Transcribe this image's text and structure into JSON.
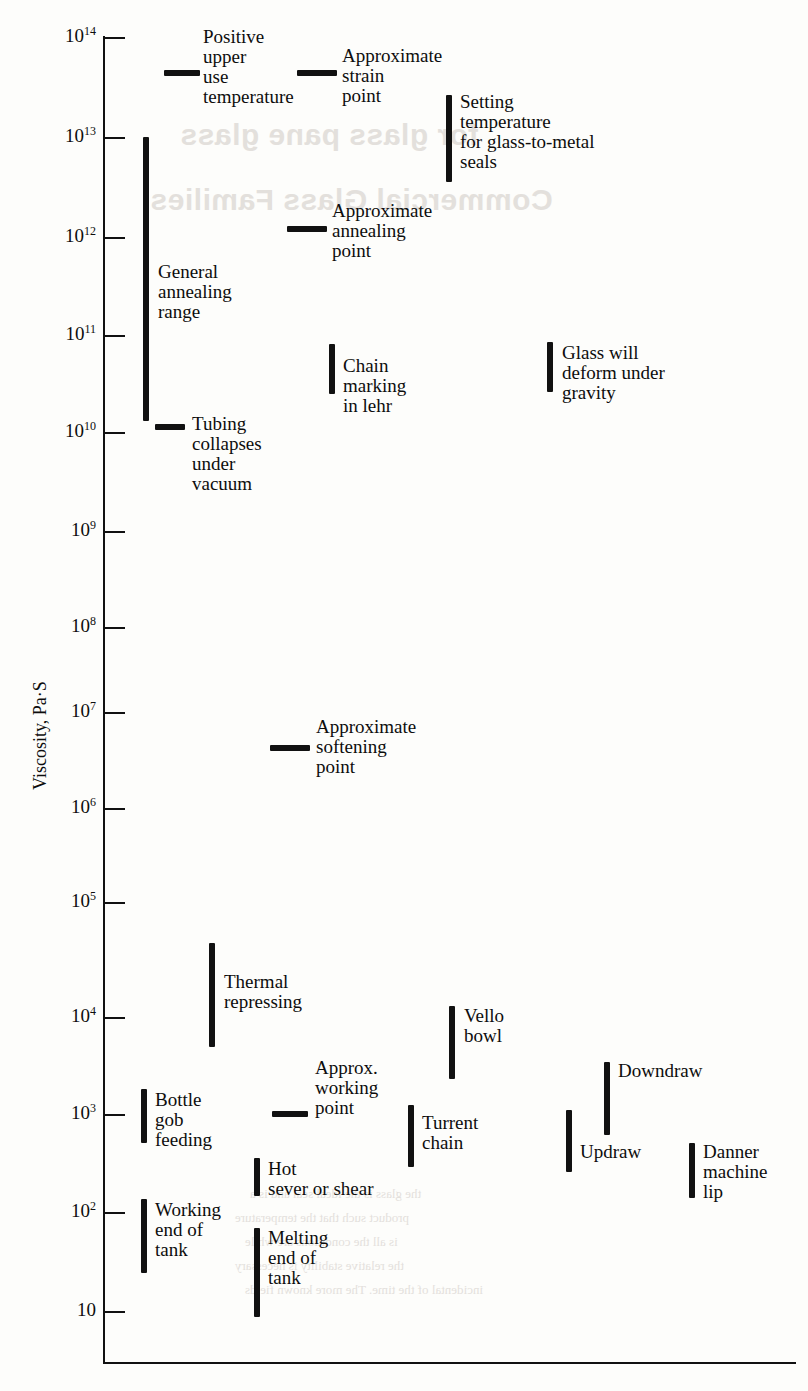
{
  "figure": {
    "y_axis_label": "Viscosity, Pa·S",
    "tick_labels": [
      "10¹⁴",
      "10¹³",
      "10¹²",
      "10¹¹",
      "10¹⁰",
      "10⁹",
      "10⁸",
      "10⁷",
      "10⁶",
      "10⁵",
      "10⁴",
      "10³",
      "10²",
      "10"
    ]
  },
  "ticks": [
    {
      "base": "10",
      "exp": "14",
      "value": 14,
      "y": 37
    },
    {
      "base": "10",
      "exp": "13",
      "value": 13,
      "y": 137
    },
    {
      "base": "10",
      "exp": "12",
      "value": 12,
      "y": 237
    },
    {
      "base": "10",
      "exp": "11",
      "value": 11,
      "y": 335
    },
    {
      "base": "10",
      "exp": "10",
      "value": 10,
      "y": 432
    },
    {
      "base": "10",
      "exp": "9",
      "value": 9,
      "y": 531
    },
    {
      "base": "10",
      "exp": "8",
      "value": 8,
      "y": 627
    },
    {
      "base": "10",
      "exp": "7",
      "value": 7,
      "y": 712
    },
    {
      "base": "10",
      "exp": "6",
      "value": 6,
      "y": 808
    },
    {
      "base": "10",
      "exp": "5",
      "value": 5,
      "y": 902
    },
    {
      "base": "10",
      "exp": "4",
      "value": 4,
      "y": 1017
    },
    {
      "base": "10",
      "exp": "3",
      "value": 3,
      "y": 1114
    },
    {
      "base": "10",
      "exp": "2",
      "value": 2,
      "y": 1212
    },
    {
      "base": "10",
      "exp": "",
      "value": 1,
      "y": 1311
    }
  ],
  "markers": [
    {
      "id": "positive-upper-use-temperature",
      "label": "Positive\nupper\nuse\ntemperature",
      "kind": "dash",
      "x": 164,
      "w": 36,
      "y": 70,
      "value_exp": 13.6,
      "label_x": 203,
      "label_y": 27
    },
    {
      "id": "approximate-strain-point",
      "label": "Approximate\nstrain\npoint",
      "kind": "dash",
      "x": 297,
      "w": 40,
      "y": 70,
      "value_exp": 13.6,
      "label_x": 342,
      "label_y": 46
    },
    {
      "id": "setting-temperature-glass-to-metal-seals",
      "label": "Setting\ntemperature\nfor glass-to-metal\nseals",
      "kind": "bar",
      "x": 446,
      "y_top": 95,
      "y_bottom": 182,
      "exp_top": 13.45,
      "exp_bottom": 12.6,
      "label_x": 460,
      "label_y": 92
    },
    {
      "id": "general-annealing-range",
      "label": "General\nannealing\nrange",
      "kind": "bar",
      "x": 143,
      "y_top": 137,
      "y_bottom": 421,
      "exp_top": 13.0,
      "exp_bottom": 10.1,
      "label_x": 158,
      "label_y": 262
    },
    {
      "id": "approximate-annealing-point",
      "label": "Approximate\nannealing\npoint",
      "kind": "dash",
      "x": 287,
      "w": 40,
      "y": 226,
      "value_exp": 12.1,
      "label_x": 332,
      "label_y": 201
    },
    {
      "id": "chain-marking-in-lehr",
      "label": "Chain\nmarking\nin lehr",
      "kind": "bar",
      "x": 329,
      "y_top": 344,
      "y_bottom": 394,
      "exp_top": 10.9,
      "exp_bottom": 10.4,
      "label_x": 343,
      "label_y": 356
    },
    {
      "id": "glass-will-deform-under-gravity",
      "label": "Glass will\ndeform under\ngravity",
      "kind": "bar",
      "x": 547,
      "y_top": 342,
      "y_bottom": 392,
      "exp_top": 10.9,
      "exp_bottom": 10.4,
      "label_x": 562,
      "label_y": 343
    },
    {
      "id": "tubing-collapses-under-vacuum",
      "label": "Tubing\ncollapses\nunder\nvacuum",
      "kind": "dash",
      "x": 155,
      "w": 30,
      "y": 424,
      "value_exp": 10.07,
      "label_x": 192,
      "label_y": 414
    },
    {
      "id": "approximate-softening-point",
      "label": "Approximate\nsoftening\npoint",
      "kind": "dash",
      "x": 270,
      "w": 40,
      "y": 745,
      "value_exp": 6.6,
      "label_x": 316,
      "label_y": 717
    },
    {
      "id": "thermal-repressing",
      "label": "Thermal\nrepressing",
      "kind": "bar",
      "x": 209,
      "y_top": 943,
      "y_bottom": 1047,
      "exp_top": 4.65,
      "exp_bottom": 3.6,
      "label_x": 224,
      "label_y": 972
    },
    {
      "id": "vello-bowl",
      "label": "Vello\nbowl",
      "kind": "bar",
      "x": 449,
      "y_top": 1006,
      "y_bottom": 1079,
      "exp_top": 4.1,
      "exp_bottom": 3.35,
      "label_x": 464,
      "label_y": 1006
    },
    {
      "id": "downdraw",
      "label": "Downdraw",
      "kind": "bar",
      "x": 604,
      "y_top": 1062,
      "y_bottom": 1135,
      "exp_top": 3.5,
      "exp_bottom": 2.8,
      "label_x": 618,
      "label_y": 1061
    },
    {
      "id": "approx-working-point",
      "label": "Approx.\nworking\npoint",
      "kind": "dash",
      "x": 272,
      "w": 36,
      "y": 1111,
      "value_exp": 3.03,
      "label_x": 315,
      "label_y": 1058
    },
    {
      "id": "bottle-gob-feeding",
      "label": "Bottle\ngob\nfeeding",
      "kind": "bar",
      "x": 141,
      "y_top": 1089,
      "y_bottom": 1143,
      "exp_top": 3.25,
      "exp_bottom": 2.7,
      "label_x": 155,
      "label_y": 1090
    },
    {
      "id": "turrent-chain",
      "label": "Turrent\nchain",
      "kind": "bar",
      "x": 408,
      "y_top": 1105,
      "y_bottom": 1167,
      "exp_top": 3.1,
      "exp_bottom": 2.45,
      "label_x": 422,
      "label_y": 1113
    },
    {
      "id": "updraw",
      "label": "Updraw",
      "kind": "bar",
      "x": 566,
      "y_top": 1110,
      "y_bottom": 1172,
      "exp_top": 3.05,
      "exp_bottom": 2.4,
      "label_x": 580,
      "label_y": 1142
    },
    {
      "id": "danner-machine-lip",
      "label": "Danner\nmachine\nlip",
      "kind": "bar",
      "x": 689,
      "y_top": 1143,
      "y_bottom": 1198,
      "exp_top": 2.7,
      "exp_bottom": 2.15,
      "label_x": 703,
      "label_y": 1142
    },
    {
      "id": "hot-sever-or-shear",
      "label": "Hot\nsever or shear",
      "kind": "bar",
      "x": 254,
      "y_top": 1158,
      "y_bottom": 1196,
      "exp_top": 2.5,
      "exp_bottom": 2.15,
      "label_x": 268,
      "label_y": 1159
    },
    {
      "id": "working-end-of-tank",
      "label": "Working\nend of\ntank",
      "kind": "bar",
      "x": 141,
      "y_top": 1199,
      "y_bottom": 1273,
      "exp_top": 2.1,
      "exp_bottom": 1.35,
      "label_x": 155,
      "label_y": 1200
    },
    {
      "id": "melting-end-of-tank",
      "label": "Melting\nend of\ntank",
      "kind": "bar",
      "x": 254,
      "y_top": 1228,
      "y_bottom": 1317,
      "exp_top": 1.85,
      "exp_bottom": 0.95,
      "label_x": 268,
      "label_y": 1228
    }
  ],
  "ghost_text": {
    "heading_line1": "Commercial Glass Families",
    "heading_line2": "for glass pane glass",
    "body": [
      "the glass is the ideal seal and is a",
      "product such that the temperature",
      "is all the conditions are while",
      "the relative stability is necessary",
      "incidental of the time. The more known fields"
    ]
  },
  "chart_data": {
    "type": "bar",
    "title": "",
    "xlabel": "",
    "ylabel": "Viscosity, Pa·S",
    "y_scale": "log10",
    "ylim": [
      1,
      14
    ],
    "grid": false,
    "legend": "none",
    "orientation": "horizontal-scatter-of-vertical-ranges",
    "categories": [
      "Positive upper use temperature",
      "Approximate strain point",
      "Setting temperature for glass-to-metal seals",
      "General annealing range",
      "Approximate annealing point",
      "Chain marking in lehr",
      "Glass will deform under gravity",
      "Tubing collapses under vacuum",
      "Approximate softening point",
      "Thermal repressing",
      "Vello bowl",
      "Downdraw",
      "Approx. working point",
      "Bottle gob feeding",
      "Turrent chain",
      "Updraw",
      "Danner machine lip",
      "Hot sever or shear",
      "Working end of tank",
      "Melting end of tank"
    ],
    "ranges_log10_pa_s": [
      [
        13.6,
        13.6
      ],
      [
        13.6,
        13.6
      ],
      [
        12.6,
        13.45
      ],
      [
        10.1,
        13.0
      ],
      [
        12.1,
        12.1
      ],
      [
        10.4,
        10.9
      ],
      [
        10.4,
        10.9
      ],
      [
        10.07,
        10.07
      ],
      [
        6.6,
        6.6
      ],
      [
        3.6,
        4.65
      ],
      [
        3.35,
        4.1
      ],
      [
        2.8,
        3.5
      ],
      [
        3.03,
        3.03
      ],
      [
        2.7,
        3.25
      ],
      [
        2.45,
        3.1
      ],
      [
        2.4,
        3.05
      ],
      [
        2.15,
        2.7
      ],
      [
        2.15,
        2.5
      ],
      [
        1.35,
        2.1
      ],
      [
        0.95,
        1.85
      ]
    ]
  }
}
